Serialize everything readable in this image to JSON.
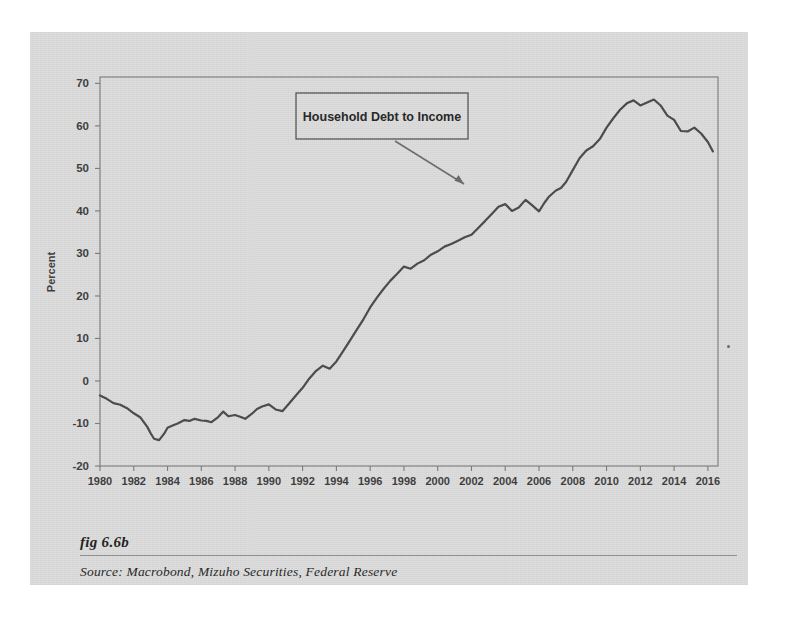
{
  "figure": {
    "label": "fig 6.6b",
    "source": "Source:  Macrobond, Mizuho Securities, Federal Reserve"
  },
  "annotation": {
    "label": "Household Debt to Income",
    "arrow_from": [
      395,
      141
    ],
    "arrow_to": [
      469,
      187
    ]
  },
  "colors": {
    "card_background": "#dcdcdc",
    "page_background": "#ffffff",
    "line": "#4a4a4a",
    "axis": "#6e6e6e",
    "text": "#3c3c3c"
  },
  "chart_data": {
    "type": "line",
    "title": "",
    "xlabel": "",
    "ylabel": "Percent",
    "xlim": [
      1980,
      2016.6
    ],
    "ylim": [
      -20,
      71.5
    ],
    "grid": false,
    "legend": "none",
    "xticks": [
      1980,
      1982,
      1984,
      1986,
      1988,
      1990,
      1992,
      1994,
      1996,
      1998,
      2000,
      2002,
      2004,
      2006,
      2008,
      2010,
      2012,
      2014,
      2016
    ],
    "yticks": [
      -20,
      -10,
      0,
      10,
      20,
      30,
      40,
      50,
      60,
      70
    ],
    "series": [
      {
        "name": "Household Debt to Income",
        "x": [
          1980.0,
          1980.4,
          1980.8,
          1981.2,
          1981.6,
          1982.0,
          1982.4,
          1982.8,
          1983.0,
          1983.2,
          1983.5,
          1983.8,
          1984.0,
          1984.3,
          1984.6,
          1985.0,
          1985.3,
          1985.6,
          1986.0,
          1986.3,
          1986.6,
          1987.0,
          1987.3,
          1987.6,
          1988.0,
          1988.3,
          1988.6,
          1989.0,
          1989.3,
          1989.6,
          1990.0,
          1990.4,
          1990.8,
          1991.2,
          1991.6,
          1992.0,
          1992.4,
          1992.8,
          1993.2,
          1993.6,
          1994.0,
          1994.4,
          1994.8,
          1995.2,
          1995.6,
          1996.0,
          1996.4,
          1996.8,
          1997.2,
          1997.6,
          1998.0,
          1998.4,
          1998.8,
          1999.2,
          1999.6,
          2000.0,
          2000.4,
          2000.8,
          2001.2,
          2001.6,
          2002.0,
          2002.4,
          2002.8,
          2003.2,
          2003.6,
          2004.0,
          2004.4,
          2004.8,
          2005.2,
          2005.6,
          2006.0,
          2006.3,
          2006.6,
          2007.0,
          2007.3,
          2007.6,
          2008.0,
          2008.4,
          2008.8,
          2009.2,
          2009.6,
          2010.0,
          2010.4,
          2010.8,
          2011.2,
          2011.6,
          2012.0,
          2012.4,
          2012.8,
          2013.2,
          2013.6,
          2014.0,
          2014.4,
          2014.8,
          2015.2,
          2015.6,
          2016.0,
          2016.3
        ],
        "y": [
          -3.4,
          -4.2,
          -5.2,
          -5.6,
          -6.4,
          -7.6,
          -8.6,
          -10.8,
          -12.3,
          -13.6,
          -13.9,
          -12.4,
          -11.0,
          -10.5,
          -10.0,
          -9.2,
          -9.4,
          -8.9,
          -9.3,
          -9.4,
          -9.7,
          -8.5,
          -7.2,
          -8.3,
          -8.0,
          -8.4,
          -8.9,
          -7.7,
          -6.6,
          -6.0,
          -5.5,
          -6.7,
          -7.1,
          -5.3,
          -3.4,
          -1.6,
          0.6,
          2.4,
          3.6,
          2.9,
          4.6,
          7.0,
          9.5,
          12.0,
          14.5,
          17.3,
          19.6,
          21.7,
          23.6,
          25.2,
          26.9,
          26.4,
          27.6,
          28.4,
          29.7,
          30.5,
          31.6,
          32.2,
          33.0,
          33.8,
          34.4,
          36.0,
          37.6,
          39.3,
          41.0,
          41.6,
          40.0,
          40.8,
          42.6,
          41.3,
          39.9,
          41.8,
          43.4,
          44.8,
          45.4,
          46.8,
          49.6,
          52.4,
          54.2,
          55.2,
          56.9,
          59.6,
          61.8,
          63.8,
          65.3,
          66.0,
          64.8,
          65.5,
          66.2,
          64.8,
          62.4,
          61.4,
          58.8,
          58.7,
          59.6,
          58.2,
          56.2,
          54.0
        ]
      }
    ],
    "annotations": [
      {
        "text": "Household Debt to Income",
        "kind": "boxed-label-with-arrow"
      }
    ]
  },
  "curve_points_px": "computed-from-chart_data"
}
